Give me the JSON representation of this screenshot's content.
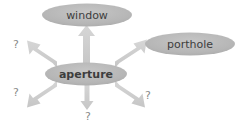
{
  "diagram": {
    "type": "radial-arrow-diagram",
    "canvas": {
      "width": 240,
      "height": 136,
      "background": "#ffffff"
    },
    "colors": {
      "ellipse_fill": "#b5b5b5",
      "ellipse_fill_light": "#bdbdbd",
      "arrow_fill": "#cfcfcf",
      "label_text": "#3d3d3d",
      "question_text": "#8a8a8a"
    },
    "center_node": {
      "label": "aperture",
      "cx": 86,
      "cy": 74,
      "rx": 41,
      "ry": 11
    },
    "outer_nodes": [
      {
        "label": "window",
        "cx": 87,
        "cy": 15,
        "rx": 45,
        "ry": 11
      },
      {
        "label": "porthole",
        "cx": 190,
        "cy": 44,
        "rx": 45,
        "ry": 11
      }
    ],
    "unknown_nodes": [
      {
        "label": "?",
        "x": 16,
        "y": 45
      },
      {
        "label": "?",
        "x": 16,
        "y": 93
      },
      {
        "label": "?",
        "x": 148,
        "y": 96
      },
      {
        "label": "?",
        "x": 88,
        "y": 117
      }
    ],
    "arrows": [
      {
        "id": "arrow-up-to-window",
        "from": "aperture",
        "to": "window",
        "direction": "up"
      },
      {
        "id": "arrow-upright-to-porthole",
        "from": "aperture",
        "to": "porthole",
        "direction": "up-right"
      },
      {
        "id": "arrow-upleft-to-unknown",
        "from": "aperture",
        "to": "?",
        "direction": "up-left"
      },
      {
        "id": "arrow-downleft-to-unknown",
        "from": "aperture",
        "to": "?",
        "direction": "down-left"
      },
      {
        "id": "arrow-downright-to-unknown",
        "from": "aperture",
        "to": "?",
        "direction": "down-right"
      },
      {
        "id": "arrow-down-to-unknown",
        "from": "aperture",
        "to": "?",
        "direction": "down"
      }
    ]
  }
}
